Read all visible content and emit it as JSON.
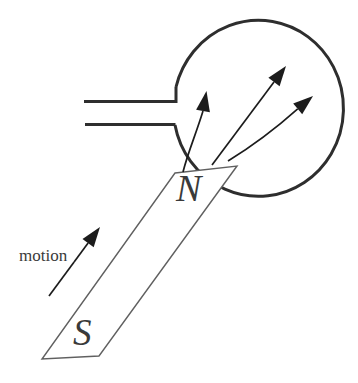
{
  "diagram": {
    "labels": {
      "north_pole": "N",
      "south_pole": "S",
      "motion": "motion"
    },
    "colors": {
      "background": "#ffffff",
      "coil_ink": "#2e2e2e",
      "magnet_ink": "#606060",
      "arrow_ink": "#1c1c1c",
      "label_ink": "#3a3a3a"
    }
  }
}
